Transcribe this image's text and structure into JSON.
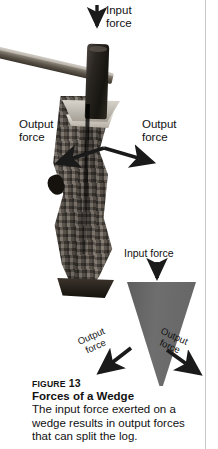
{
  "figure": {
    "photo_alt_name": "photo-hammer-wedge-log",
    "labels": {
      "input_force_top": "Input\nforce",
      "output_force_left": "Output\nforce",
      "output_force_right": "Output\nforce",
      "input_force_diagram": "Input force",
      "output_force_diagram_left": "Output\nforce",
      "output_force_diagram_right": "Output\nforce"
    },
    "caption": {
      "figure_word": "Figure",
      "figure_number": "13",
      "title": "Forces of a Wedge",
      "body": "The input force exerted on a wedge results in output forces that can split the log."
    },
    "colors": {
      "wedge_fill": "#6a6a6a",
      "arrow": "#1a1a1a",
      "text": "#111111",
      "rule": "#c9c9c9",
      "background": "#ffffff"
    }
  }
}
